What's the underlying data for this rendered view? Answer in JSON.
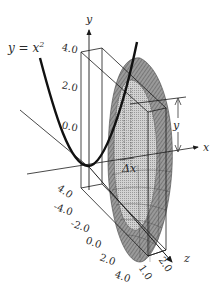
{
  "figure": {
    "equation_label": "y = x",
    "equation_exponent": "2",
    "axes": {
      "x_label": "x",
      "y_label": "y",
      "z_label": "z"
    },
    "y_ticks": [
      "4.0",
      "2.0",
      "0.0",
      "4.0"
    ],
    "z_ticks": [
      "-4.0",
      "-2.0",
      "0.0",
      "2.0",
      "4.0"
    ],
    "depth_ticks": [
      "1.0",
      "2.0"
    ],
    "slice_label": "Δx",
    "radius_label": "y",
    "colors": {
      "ink": "#1a1a1a",
      "disk_fill": "#8a8a8a",
      "disk_light": "#cfcfcf",
      "background": "#ffffff"
    }
  }
}
